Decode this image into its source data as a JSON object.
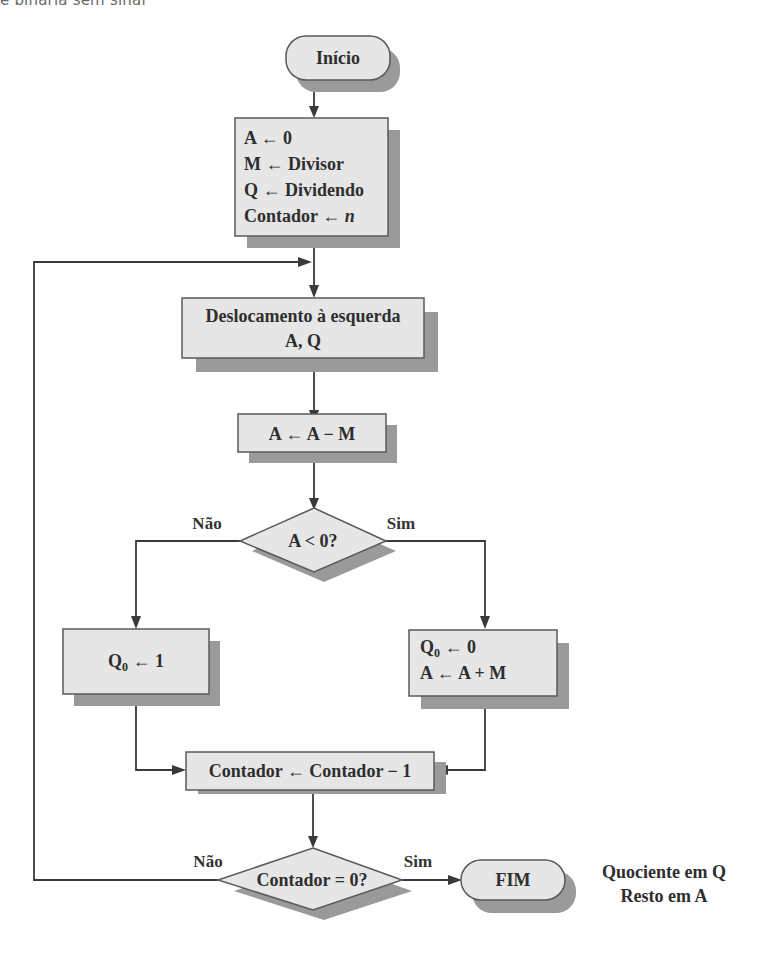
{
  "caption": "e binária sem sinal",
  "nodes": {
    "start": {
      "label": "Início"
    },
    "init": {
      "lines": [
        "A ← 0",
        "M ← Divisor",
        "Q ← Dividendo",
        "Contador ← "
      ],
      "italic_var": "n"
    },
    "shift": {
      "lines": [
        "Deslocamento à esquerda",
        "A, Q"
      ]
    },
    "subtract": {
      "label": "A ← A − M"
    },
    "decision_sign": {
      "label": "A < 0?",
      "no_label": "Não",
      "yes_label": "Sim"
    },
    "set_one": {
      "q_prefix": "Q",
      "q_sub": "0",
      "rest": " ← 1"
    },
    "set_zero": {
      "q_prefix": "Q",
      "q_sub": "0",
      "rest": " ← 0",
      "line2": "A ← A + M"
    },
    "decrement": {
      "label": "Contador ← Contador − 1"
    },
    "decision_counter": {
      "label": "Contador = 0?",
      "no_label": "Não",
      "yes_label": "Sim"
    },
    "end": {
      "label": "FIM"
    },
    "result_note": {
      "lines": [
        "Quociente em Q",
        "Resto em A"
      ]
    }
  },
  "colors": {
    "box_fill": "#e6e6e6",
    "box_stroke": "#5a5a5a",
    "shadow": "#9a9a9a",
    "line": "#3a3a3a",
    "text": "#2e2e2e"
  }
}
